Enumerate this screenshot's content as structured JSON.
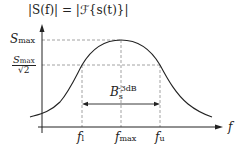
{
  "diagram": {
    "title": "|S(f)| = |ℱ{s(t)}|",
    "title_parts": {
      "left": "|",
      "S": "S",
      "arg": "(f)| = |",
      "cal": "ℱ",
      "rest": "{s(t)} |"
    },
    "y_axis": {
      "label": "|S(f)| = |ℱ{s(t)}|"
    },
    "x_axis": {
      "label": "f"
    },
    "y_ticks": [
      {
        "main": "S",
        "sub": "max"
      },
      {
        "num_main": "S",
        "num_sub": "max",
        "den": "√2"
      }
    ],
    "x_ticks": [
      {
        "main": "f",
        "sub": "l"
      },
      {
        "main": "f",
        "sub": "max"
      },
      {
        "main": "f",
        "sub": "u"
      }
    ],
    "bandwidth": {
      "main": "B",
      "sub": "s",
      "sup": "-3dB"
    },
    "colors": {
      "curve": "#222222",
      "dashed": "#888888",
      "axis": "#222222"
    }
  }
}
